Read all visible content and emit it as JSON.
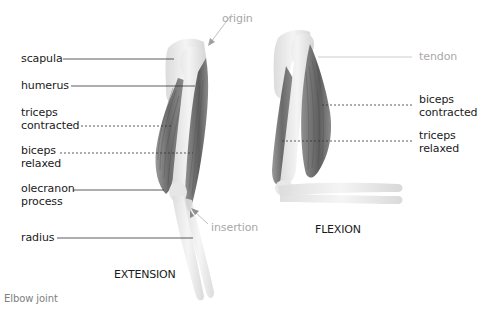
{
  "caption": "Elbow joint",
  "colors": {
    "label_text": "#1a1a1a",
    "label_muted": "#a8a8a8",
    "caption_text": "#808080",
    "bone_fill": "#ececec",
    "muscle_dark": "#6b6b6b",
    "muscle_light": "#a9a9a9",
    "background": "#ffffff"
  },
  "extension": {
    "title": "EXTENSION",
    "labels": {
      "scapula": "scapula",
      "humerus": "humerus",
      "triceps_contracted_1": "triceps",
      "triceps_contracted_2": "contracted",
      "biceps_relaxed_1": "biceps",
      "biceps_relaxed_2": "relaxed",
      "olecranon_1": "olecranon",
      "olecranon_2": "process",
      "radius": "radius",
      "origin": "origin",
      "insertion": "insertion"
    }
  },
  "flexion": {
    "title": "FLEXION",
    "labels": {
      "tendon": "tendon",
      "biceps_contracted_1": "biceps",
      "biceps_contracted_2": "contracted",
      "triceps_relaxed_1": "triceps",
      "triceps_relaxed_2": "relaxed"
    }
  }
}
